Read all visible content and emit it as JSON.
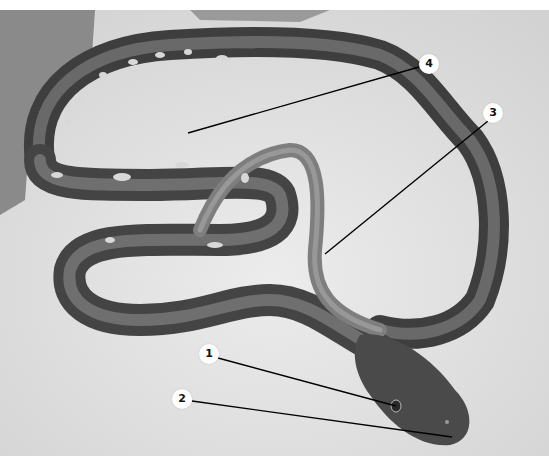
{
  "figure": {
    "background_color": "#e4e4e4",
    "callouts": [
      {
        "label": "1",
        "x": 209,
        "y": 354,
        "target": [
          396,
          406
        ]
      },
      {
        "label": "2",
        "x": 182,
        "y": 399,
        "target": [
          452,
          437
        ]
      },
      {
        "label": "3",
        "x": 493,
        "y": 113,
        "target": [
          325,
          254
        ]
      },
      {
        "label": "4",
        "x": 429,
        "y": 64,
        "target": [
          188,
          133
        ]
      }
    ]
  }
}
